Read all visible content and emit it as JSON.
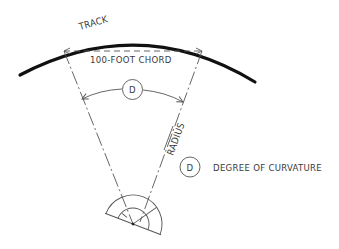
{
  "diagram": {
    "labels": {
      "track": "TRACK",
      "chord": "100-FOOT CHORD",
      "radius": "RADIUS",
      "angle_symbol": "D",
      "legend_symbol": "D",
      "legend_text": "DEGREE OF CURVATURE"
    },
    "elements": [
      {
        "name": "track",
        "kind": "thick curved line"
      },
      {
        "name": "chord",
        "kind": "dashed straight line",
        "label": "100-FOOT CHORD"
      },
      {
        "name": "radius-left",
        "kind": "dash-dot line to protractor"
      },
      {
        "name": "radius-right",
        "kind": "dash-dot line to protractor",
        "label": "RADIUS"
      },
      {
        "name": "angle-arc",
        "kind": "arc with arrows",
        "label": "D"
      },
      {
        "name": "protractor",
        "kind": "semicircular protractor at curve center"
      }
    ],
    "colors": {
      "track": "#111111",
      "lines": "#555555",
      "text": "#3a3a3a",
      "background": "#ffffff"
    }
  }
}
